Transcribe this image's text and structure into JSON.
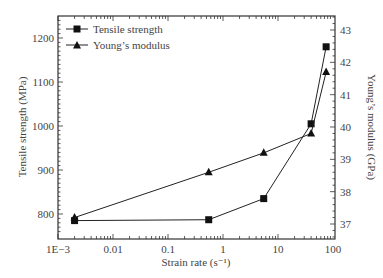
{
  "chart_data": {
    "type": "line",
    "title": "",
    "xlabel": "Strain rate (s⁻¹)",
    "xscale": "log",
    "xlim": [
      0.001,
      100
    ],
    "xticks": [
      {
        "value": 0.001,
        "label": "1E−3"
      },
      {
        "value": 0.01,
        "label": "0.01"
      },
      {
        "value": 0.1,
        "label": "0.1"
      },
      {
        "value": 1,
        "label": "1"
      },
      {
        "value": 10,
        "label": "10"
      },
      {
        "value": 100,
        "label": "100"
      }
    ],
    "ylabel": "Tensile strength (MPa)",
    "ylim": [
      750,
      1250
    ],
    "yticks": [
      800,
      900,
      1000,
      1100,
      1200
    ],
    "y2label": "Young’s modulus (GPa)",
    "y2lim": [
      36.5,
      43.5
    ],
    "y2ticks": [
      37,
      38,
      39,
      40,
      41,
      42,
      43
    ],
    "grid": false,
    "legend_position": "upper left",
    "series": [
      {
        "name": "Tensile strength",
        "marker": "square",
        "axis": "left",
        "x": [
          0.002,
          0.55,
          5.5,
          40,
          75
        ],
        "values": [
          785,
          787,
          835,
          1005,
          1180
        ]
      },
      {
        "name": "Young’s modulus",
        "marker": "triangle",
        "axis": "right",
        "x": [
          0.002,
          0.55,
          5.5,
          40,
          75
        ],
        "values": [
          37.2,
          38.6,
          39.2,
          39.8,
          41.7
        ]
      }
    ]
  },
  "colors": {
    "line": "#222222",
    "axis": "#333333",
    "text": "#444444"
  }
}
